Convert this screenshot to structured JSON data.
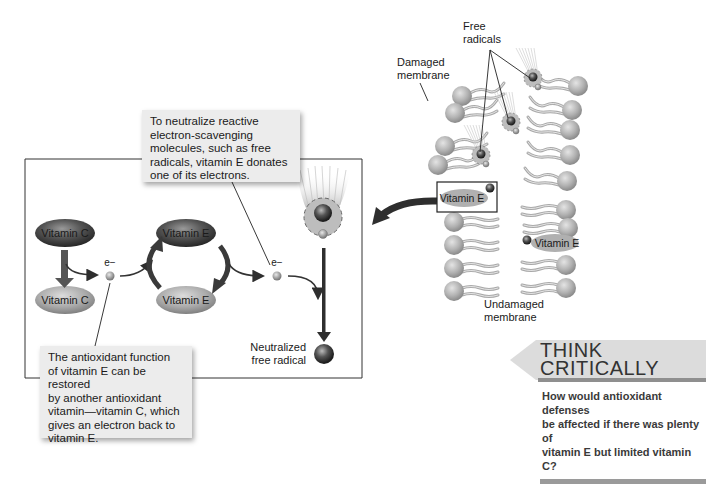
{
  "callouts": {
    "donate": {
      "lines": [
        "To neutralize reactive",
        "electron-scavenging",
        "molecules, such as free",
        "radicals, vitamin E donates",
        "one of its electrons."
      ]
    },
    "restore": {
      "lines": [
        "The antioxidant function",
        "of vitamin E can be restored",
        "by another antioxidant",
        "vitamin—vitamin C, which",
        "gives an electron back to",
        "vitamin E."
      ]
    }
  },
  "cycle": {
    "vitamin_c_top": "Vitamin C",
    "vitamin_c_bottom": "Vitamin C",
    "vitamin_e_top": "Vitamin E",
    "vitamin_e_bottom": "Vitamin E",
    "electron_left": "e−",
    "electron_right": "e−",
    "neutralized_line1": "Neutralized",
    "neutralized_line2": "free radical"
  },
  "membrane": {
    "free_radicals_line1": "Free",
    "free_radicals_line2": "radicals",
    "damaged_line1": "Damaged",
    "damaged_line2": "membrane",
    "undamaged_line1": "Undamaged",
    "undamaged_line2": "membrane",
    "vitamin_e_boxed": "Vitamin E",
    "vitamin_e_inner": "Vitamin E"
  },
  "think_critically": {
    "title_line1": "THINK",
    "title_line2": "CRITICALLY",
    "question_lines": [
      "How would antioxidant defenses",
      "be affected if there was plenty of",
      "vitamin E but limited vitamin C?"
    ]
  },
  "colors": {
    "ellipse_dark": "#3a3a3a",
    "ellipse_light": "#a8a8a8",
    "callout_bg": "#ececec",
    "arrow": "#2e2e2e",
    "head": "#b0b0b0"
  }
}
